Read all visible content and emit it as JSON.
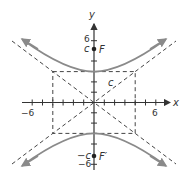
{
  "diagram": {
    "type": "hyperbola",
    "equation": "y^2/9 - x^2/16 = 1",
    "a_vertical": 3,
    "b_horizontal": 4,
    "c": 5,
    "colors": {
      "curve": "#8a8a8a",
      "axes": "#333333",
      "dashed": "#444444",
      "background": "#ffffff"
    }
  },
  "labels": {
    "x_axis": "x",
    "y_axis": "y",
    "x_neg": "−6",
    "x_pos": "6",
    "y_pos": "6",
    "y_neg": "−6",
    "c_top": "c",
    "c_bottom": "−c",
    "focus_top": "F",
    "focus_bottom": "F′",
    "c_diagonal": "c"
  }
}
